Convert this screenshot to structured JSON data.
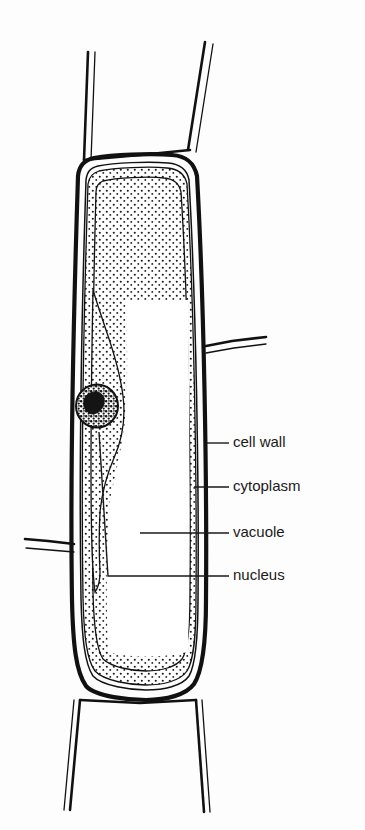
{
  "figure": {
    "background_color": "#fdfdfd",
    "ink_color": "#111111",
    "width": 365,
    "height": 830
  },
  "labels": [
    {
      "id": "cell-wall",
      "text": "cell wall",
      "x": 233,
      "y": 443,
      "leader_from_x": 207,
      "leader_to_x": 229,
      "leader_y": 443
    },
    {
      "id": "cytoplasm",
      "text": "cytoplasm",
      "x": 233,
      "y": 487,
      "leader_from_x": 196,
      "leader_to_x": 229,
      "leader_y": 487
    },
    {
      "id": "vacuole",
      "text": "vacuole",
      "x": 233,
      "y": 533,
      "leader_from_x": 140,
      "leader_to_x": 229,
      "leader_y": 533
    },
    {
      "id": "nucleus",
      "text": "nucleus",
      "x": 233,
      "y": 576,
      "leader_from_x": 108,
      "leader_to_x": 229,
      "leader_y": 576
    }
  ],
  "structures": {
    "cell_wall": {
      "name": "cell wall",
      "description": "thick dark outline enclosing the elongated plant cell"
    },
    "cytoplasm": {
      "name": "cytoplasm",
      "description": "thin stippled band lining the inside of the cell wall, swelling around the nucleus"
    },
    "vacuole": {
      "name": "vacuole",
      "description": "large white central space filling most of the cell"
    },
    "nucleus": {
      "name": "nucleus",
      "description": "dark stippled round body embedded in the cytoplasm on the left side",
      "center_x": 97,
      "center_y": 406,
      "radius": 21
    },
    "neighbor_cells": {
      "name": "adjacent cell walls",
      "description": "walls of neighbouring cells branching off at top, bottom, right and left"
    }
  }
}
